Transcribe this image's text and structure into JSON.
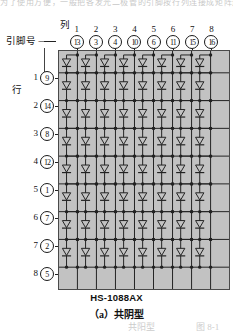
{
  "page": {
    "top_bleed_text": "为了使用方便，一般把各发光二极管的引脚按行列连接成矩阵形式",
    "bottom_bleed_left": "共阳型",
    "bottom_bleed_right": "图 8-1"
  },
  "diagram": {
    "title_column": "列",
    "title_pin": "引脚号 —",
    "title_row": "行",
    "chip_label": "HS-1088AX",
    "sub_caption": "（a）共阴型",
    "matrix_bg_color": "#c2c2c2",
    "line_color": "#222222",
    "columns": [
      {
        "index": "1",
        "pin": "13"
      },
      {
        "index": "2",
        "pin": "3"
      },
      {
        "index": "3",
        "pin": "4"
      },
      {
        "index": "4",
        "pin": "10"
      },
      {
        "index": "5",
        "pin": "6"
      },
      {
        "index": "6",
        "pin": "11"
      },
      {
        "index": "7",
        "pin": "15"
      },
      {
        "index": "8",
        "pin": "16"
      }
    ],
    "rows": [
      {
        "index": "1",
        "pin": "9"
      },
      {
        "index": "2",
        "pin": "14"
      },
      {
        "index": "3",
        "pin": "8"
      },
      {
        "index": "4",
        "pin": "12"
      },
      {
        "index": "5",
        "pin": "1"
      },
      {
        "index": "6",
        "pin": "7"
      },
      {
        "index": "7",
        "pin": "2"
      },
      {
        "index": "8",
        "pin": "5"
      }
    ],
    "grid": {
      "rows": 8,
      "cols": 8,
      "element": "led-diode"
    }
  }
}
